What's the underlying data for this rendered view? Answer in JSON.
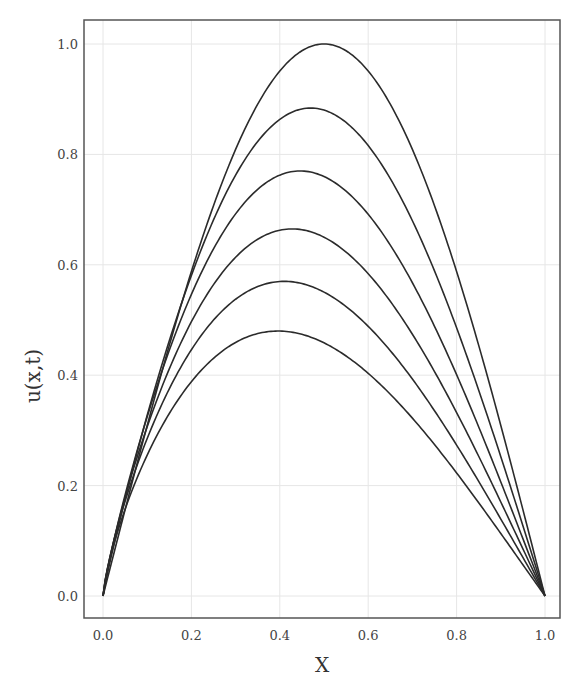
{
  "chart_data": {
    "type": "line",
    "title": "",
    "xlabel": "X",
    "ylabel": "u(x,t)",
    "xlim": [
      -0.07,
      1.04
    ],
    "ylim": [
      -0.04,
      1.05
    ],
    "grid": true,
    "legend": "none",
    "x_ticks": [
      "0.0",
      "0.2",
      "0.4",
      "0.6",
      "0.8",
      "1.0"
    ],
    "y_ticks": [
      "0.0",
      "0.2",
      "0.4",
      "0.6",
      "0.8",
      "1.0"
    ],
    "series": [
      {
        "name": "t0",
        "peak_x": 0.5,
        "peak_u": 1.0
      },
      {
        "name": "t1",
        "peak_x": 0.47,
        "peak_u": 0.884
      },
      {
        "name": "t2",
        "peak_x": 0.446,
        "peak_u": 0.77
      },
      {
        "name": "t3",
        "peak_x": 0.428,
        "peak_u": 0.665
      },
      {
        "name": "t4",
        "peak_x": 0.41,
        "peak_u": 0.57
      },
      {
        "name": "t5",
        "peak_x": 0.396,
        "peak_u": 0.48
      }
    ],
    "line_color": "#2b2b2b"
  }
}
